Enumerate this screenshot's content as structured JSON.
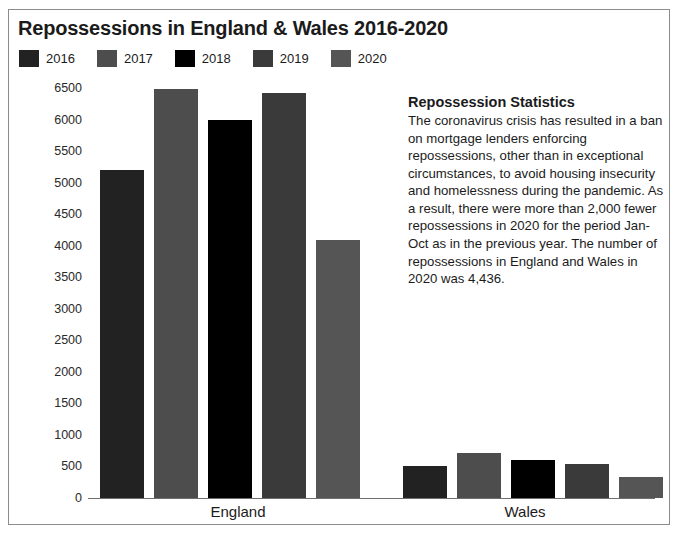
{
  "chart_data": {
    "type": "bar",
    "title": "Repossessions in England & Wales 2016-2020",
    "xlabel": "",
    "ylabel": "",
    "ylim": [
      0,
      6500
    ],
    "ytick_step": 500,
    "yticks": [
      6500,
      6000,
      5500,
      5000,
      4500,
      4000,
      3500,
      3000,
      2500,
      2000,
      1500,
      1000,
      500,
      0
    ],
    "grid": false,
    "legend_position": "top-left",
    "categories": [
      "England",
      "Wales"
    ],
    "series": [
      {
        "name": "2016",
        "color": "#222222",
        "values": [
          5200,
          500
        ]
      },
      {
        "name": "2017",
        "color": "#4d4d4d",
        "values": [
          6490,
          710
        ]
      },
      {
        "name": "2018",
        "color": "#000000",
        "values": [
          6000,
          600
        ]
      },
      {
        "name": "2019",
        "color": "#3a3a3a",
        "values": [
          6420,
          545
        ]
      },
      {
        "name": "2020",
        "color": "#555555",
        "values": [
          4090,
          340
        ]
      }
    ]
  },
  "legend": {
    "items": [
      {
        "label": "2016",
        "color": "#222222"
      },
      {
        "label": "2017",
        "color": "#4d4d4d"
      },
      {
        "label": "2018",
        "color": "#000000"
      },
      {
        "label": "2019",
        "color": "#3a3a3a"
      },
      {
        "label": "2020",
        "color": "#555555"
      }
    ]
  },
  "side_panel": {
    "title": "Repossession Statistics",
    "body": "The coronavirus crisis has resulted in a ban on mortgage lenders enforcing repossessions, other than in exceptional circumstances, to avoid housing insecurity and homelessness during the pandemic. As a result, there were more than 2,000 fewer repossessions in 2020 for the period Jan-Oct as in the previous year. The number of repossessions in England and Wales in 2020 was 4,436."
  }
}
